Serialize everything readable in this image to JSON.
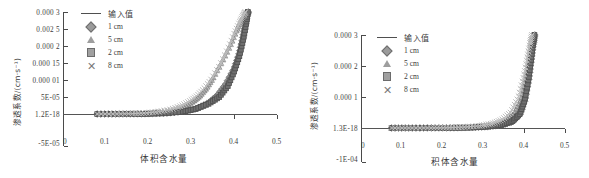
{
  "figure": {
    "panels": [
      {
        "id": "left",
        "y_axis_title": "渗透系数/(cm·s⁻¹)",
        "x_axis_title": "体积含水量",
        "y_ticks": [
          "0.000 3",
          "0.002 5",
          "0.000 2",
          "0.000 15",
          "0.000 01",
          "5E-05",
          "1.2E-18",
          "-5E-05"
        ],
        "x_ticks": [
          "0",
          "0.1",
          "0.2",
          "0.3",
          "0.4",
          "0.5"
        ],
        "legend": [
          {
            "label": "输入值",
            "marker": "line"
          },
          {
            "label": "1 cm",
            "marker": "diamond"
          },
          {
            "label": "5 cm",
            "marker": "triangle"
          },
          {
            "label": "2 cm",
            "marker": "square"
          },
          {
            "label": "8 cm",
            "marker": "cross"
          }
        ]
      },
      {
        "id": "right",
        "y_axis_title": "渗透系数/(cm·s⁻¹)",
        "x_axis_title": "积体含水量",
        "y_ticks": [
          "0.000 3",
          "0.000 2",
          "0.000 1",
          "1.3E-18",
          "-1E-04"
        ],
        "x_ticks": [
          "0",
          "0.1",
          "0.2",
          "0.3",
          "0.4",
          "0.5"
        ],
        "legend": [
          {
            "label": "输入值",
            "marker": "line"
          },
          {
            "label": "1 cm",
            "marker": "diamond"
          },
          {
            "label": "5 cm",
            "marker": "triangle"
          },
          {
            "label": "2 cm",
            "marker": "square"
          },
          {
            "label": "8 cm",
            "marker": "cross"
          }
        ]
      }
    ]
  },
  "chart_data": [
    {
      "type": "scatter",
      "panel": "left",
      "title": "",
      "xlabel": "体积含水量",
      "ylabel": "渗透系数/(cm·s⁻¹)",
      "xlim": [
        0,
        0.5
      ],
      "ylim": [
        -5e-05,
        0.0003
      ],
      "ytick_values": [
        0.0003,
        0.00025,
        0.0002,
        0.00015,
        0.0001,
        5e-05,
        1.2e-18,
        -5e-05
      ],
      "ytick_labels": [
        "0.000 3",
        "0.002 5",
        "0.000 2",
        "0.000 15",
        "0.000 01",
        "5E-05",
        "1.2E-18",
        "-5E-05"
      ],
      "xtick_values": [
        0,
        0.1,
        0.2,
        0.3,
        0.4,
        0.5
      ],
      "xtick_labels": [
        "0",
        "0.1",
        "0.2",
        "0.3",
        "0.4",
        "0.5"
      ],
      "grid": false,
      "legend_position": "top-center",
      "series": [
        {
          "name": "输入值",
          "marker": "line",
          "x": [
            0.08,
            0.12,
            0.16,
            0.2,
            0.24,
            0.28,
            0.31,
            0.34,
            0.36,
            0.38,
            0.395,
            0.405,
            0.412,
            0.418,
            0.422,
            0.426,
            0.429,
            0.431
          ],
          "y": [
            0.0,
            0.0,
            2e-07,
            8e-07,
            2.5e-06,
            7.5e-06,
            1.6e-05,
            3.2e-05,
            5.2e-05,
            8.5e-05,
            0.00012,
            0.00016,
            0.0002,
            0.00024,
            0.000265,
            0.000282,
            0.000293,
            0.0003
          ]
        },
        {
          "name": "1 cm",
          "marker": "diamond",
          "x": [
            0.08,
            0.12,
            0.16,
            0.2,
            0.24,
            0.28,
            0.31,
            0.34,
            0.36,
            0.38,
            0.4,
            0.412,
            0.42,
            0.426,
            0.43,
            0.433
          ],
          "y": [
            0.0,
            0.0,
            2e-07,
            8e-07,
            2.5e-06,
            7.5e-06,
            1.6e-05,
            3.3e-05,
            5.4e-05,
            8.8e-05,
            0.000135,
            0.00018,
            0.000225,
            0.000265,
            0.000288,
            0.0003
          ]
        },
        {
          "name": "5 cm",
          "marker": "triangle",
          "x": [
            0.08,
            0.12,
            0.16,
            0.2,
            0.23,
            0.26,
            0.285,
            0.305,
            0.32,
            0.335,
            0.35,
            0.37,
            0.39,
            0.405,
            0.415,
            0.423,
            0.428
          ],
          "y": [
            0.0,
            1e-07,
            5e-07,
            2e-06,
            5.5e-06,
            1.2e-05,
            2.3e-05,
            3.8e-05,
            5.4e-05,
            7.6e-05,
            0.000105,
            0.00015,
            0.0002,
            0.000245,
            0.000272,
            0.00029,
            0.0003
          ]
        },
        {
          "name": "2 cm",
          "marker": "square",
          "x": [
            0.08,
            0.12,
            0.16,
            0.2,
            0.24,
            0.28,
            0.31,
            0.34,
            0.365,
            0.385,
            0.4,
            0.412,
            0.421,
            0.428,
            0.432
          ],
          "y": [
            0.0,
            0.0,
            2e-07,
            7e-07,
            2.2e-06,
            6.8e-06,
            1.45e-05,
            3e-05,
            5e-05,
            8.2e-05,
            0.000125,
            0.00017,
            0.000218,
            0.000265,
            0.0003
          ]
        },
        {
          "name": "8 cm",
          "marker": "cross",
          "x": [
            0.08,
            0.12,
            0.16,
            0.19,
            0.22,
            0.25,
            0.275,
            0.295,
            0.312,
            0.328,
            0.345,
            0.365,
            0.385,
            0.4,
            0.412,
            0.42,
            0.426
          ],
          "y": [
            1e-07,
            3e-07,
            1e-06,
            2.8e-06,
            6.5e-06,
            1.3e-05,
            2.35e-05,
            3.7e-05,
            5.2e-05,
            7.2e-05,
            9.9e-05,
            0.00014,
            0.00019,
            0.000235,
            0.000268,
            0.000288,
            0.0003
          ]
        }
      ]
    },
    {
      "type": "scatter",
      "panel": "right",
      "title": "",
      "xlabel": "积体含水量",
      "ylabel": "渗透系数/(cm·s⁻¹)",
      "xlim": [
        0,
        0.5
      ],
      "ylim": [
        -0.0001,
        0.0003
      ],
      "ytick_values": [
        0.0003,
        0.0002,
        0.0001,
        1.3e-18,
        -0.0001
      ],
      "ytick_labels": [
        "0.000 3",
        "0.000 2",
        "0.000 1",
        "1.3E-18",
        "-1E-04"
      ],
      "xtick_values": [
        0,
        0.1,
        0.2,
        0.3,
        0.4,
        0.5
      ],
      "xtick_labels": [
        "0",
        "0.1",
        "0.2",
        "0.3",
        "0.4",
        "0.5"
      ],
      "grid": false,
      "legend_position": "top-center",
      "series": [
        {
          "name": "输入值",
          "marker": "line",
          "x": [
            0.075,
            0.12,
            0.17,
            0.22,
            0.27,
            0.31,
            0.34,
            0.365,
            0.385,
            0.398,
            0.407,
            0.413,
            0.418,
            0.421,
            0.424
          ],
          "y": [
            0.0,
            0.0,
            1e-07,
            4e-07,
            1.5e-06,
            4.5e-06,
            1e-05,
            2e-05,
            4.2e-05,
            8.5e-05,
            0.000145,
            0.000205,
            0.000255,
            0.000285,
            0.0003
          ]
        },
        {
          "name": "1 cm",
          "marker": "diamond",
          "x": [
            0.075,
            0.12,
            0.17,
            0.22,
            0.27,
            0.31,
            0.345,
            0.372,
            0.39,
            0.402,
            0.411,
            0.417,
            0.422,
            0.426
          ],
          "y": [
            0.0,
            0.0,
            1e-07,
            4e-07,
            1.4e-06,
            4.2e-06,
            9.8e-06,
            2.05e-05,
            4.4e-05,
            9e-05,
            0.000155,
            0.000215,
            0.000268,
            0.0003
          ]
        },
        {
          "name": "5 cm",
          "marker": "triangle",
          "x": [
            0.075,
            0.12,
            0.17,
            0.22,
            0.26,
            0.3,
            0.33,
            0.355,
            0.375,
            0.392,
            0.403,
            0.411,
            0.417,
            0.421
          ],
          "y": [
            0.0,
            1e-07,
            2e-07,
            6e-07,
            2e-06,
            5.5e-06,
            1.15e-05,
            2.3e-05,
            4.6e-05,
            9.2e-05,
            0.000158,
            0.000218,
            0.00027,
            0.0003
          ]
        },
        {
          "name": "2 cm",
          "marker": "square",
          "x": [
            0.075,
            0.12,
            0.17,
            0.22,
            0.27,
            0.31,
            0.345,
            0.37,
            0.389,
            0.401,
            0.41,
            0.416,
            0.421,
            0.425
          ],
          "y": [
            0.0,
            0.0,
            1e-07,
            4e-07,
            1.5e-06,
            4.4e-06,
            1e-05,
            2.1e-05,
            4.5e-05,
            8.9e-05,
            0.000152,
            0.000212,
            0.000265,
            0.0003
          ]
        },
        {
          "name": "8 cm",
          "marker": "cross",
          "x": [
            0.075,
            0.12,
            0.17,
            0.21,
            0.25,
            0.29,
            0.32,
            0.345,
            0.367,
            0.385,
            0.398,
            0.407,
            0.414,
            0.419
          ],
          "y": [
            1e-07,
            2e-07,
            4e-07,
            1e-06,
            2.8e-06,
            7e-06,
            1.4e-05,
            2.65e-05,
            5e-05,
            9.6e-05,
            0.00016,
            0.00022,
            0.000272,
            0.0003
          ]
        }
      ]
    }
  ]
}
